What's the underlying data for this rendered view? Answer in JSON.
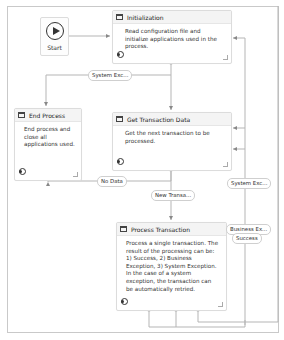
{
  "start": {
    "label": "Start",
    "icon": "play-circle-icon"
  },
  "states": [
    {
      "id": "init",
      "title": "Initialization",
      "description": "Read configuration file and initialize applications used in the process."
    },
    {
      "id": "end",
      "title": "End Process",
      "description": "End process and close all applications used."
    },
    {
      "id": "get",
      "title": "Get Transaction Data",
      "description": "Get the next transaction to be processed."
    },
    {
      "id": "process",
      "title": "Process Transaction",
      "description": "Process a single transaction. The result of the processing can be: 1) Success, 2) Business Exception, 3) System Exception. In the case of a system exception, the transaction can be automatically retried."
    }
  ],
  "transitions": {
    "system_exc_init": "System Exc...",
    "no_data": "No Data",
    "new_transaction": "New Transa...",
    "system_exc_process": "System Exc...",
    "business_exc": "Business Ex...",
    "success": "Success"
  },
  "colors": {
    "wire": "#b5b5b5",
    "border": "#c9c9c9",
    "header": "#f4f4f4"
  }
}
